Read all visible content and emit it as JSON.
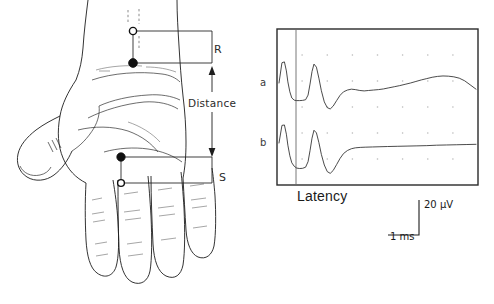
{
  "figure": {
    "background_color": "#ffffff",
    "ink_color": "#1d1d1d",
    "width": 494,
    "height": 304
  },
  "hand_panel": {
    "name": "hand-diagram",
    "description": "Line drawing of a palmar view of a left hand with forearm, showing surface electrode placement",
    "labels": {
      "recording_electrode": "R",
      "stimulating_electrode": "S",
      "distance_label": "Distance"
    },
    "electrodes": [
      {
        "id": "R-reference",
        "label": "R",
        "type": "open-circle",
        "role": "reference"
      },
      {
        "id": "R-active",
        "label": "R",
        "type": "filled-circle",
        "role": "active"
      },
      {
        "id": "S-cathode",
        "label": "S",
        "type": "filled-circle",
        "role": "cathode"
      },
      {
        "id": "S-anode",
        "label": "S",
        "type": "open-circle",
        "role": "anode"
      }
    ]
  },
  "plot_panel": {
    "name": "emg-oscilloscope-trace",
    "x_axis_label": "Latency",
    "trace_labels": [
      "a",
      "b"
    ],
    "scale_bar": {
      "amplitude": "20 µV",
      "time": "1 ms"
    },
    "grid": {
      "columns": 8,
      "rows": 6,
      "style": "dots"
    },
    "cursor": {
      "present": true,
      "orientation": "vertical",
      "meaning": "latency marker"
    }
  },
  "chart_data": {
    "type": "line",
    "title": "",
    "xlabel": "Latency",
    "ylabel": "",
    "grid": true,
    "legend": "none",
    "axis_units": {
      "x": "ms",
      "y": "µV"
    },
    "scale_bar": {
      "x_per_division": "1 ms",
      "y_per_division": "20 µV"
    },
    "xlim": [
      0,
      8
    ],
    "series": [
      {
        "name": "a",
        "label": "a",
        "note": "Upper trace: stimulus artifact, large sensory nerve action potential, then slow broad late wave",
        "x": [
          0.0,
          0.12,
          0.22,
          0.3,
          0.36,
          0.44,
          0.52,
          0.62,
          0.72,
          0.84,
          0.96,
          1.08,
          1.18,
          1.26,
          1.34,
          1.42,
          1.52,
          1.62,
          1.72,
          1.84,
          1.96,
          2.08,
          2.2,
          2.34,
          2.48,
          2.62,
          2.78,
          2.94,
          3.1,
          3.28,
          3.46,
          3.64,
          3.84,
          4.04,
          4.24,
          4.46,
          4.68,
          4.9,
          5.12,
          5.34,
          5.56,
          5.78,
          6.0,
          6.22,
          6.44,
          6.66,
          6.88,
          7.1,
          7.32,
          7.54,
          7.76,
          8.0
        ],
        "y": [
          0.0,
          0.92,
          0.96,
          0.55,
          0.05,
          -0.4,
          -0.68,
          -0.78,
          -0.8,
          -0.8,
          -0.79,
          -0.76,
          -0.55,
          -0.05,
          0.52,
          0.86,
          0.72,
          0.22,
          -0.35,
          -0.86,
          -1.12,
          -1.18,
          -1.05,
          -0.8,
          -0.56,
          -0.4,
          -0.32,
          -0.28,
          -0.3,
          -0.34,
          -0.36,
          -0.34,
          -0.32,
          -0.3,
          -0.27,
          -0.22,
          -0.17,
          -0.12,
          -0.06,
          0.0,
          0.07,
          0.14,
          0.2,
          0.26,
          0.3,
          0.32,
          0.31,
          0.28,
          0.22,
          0.1,
          -0.08,
          -0.28
        ]
      },
      {
        "name": "b",
        "label": "b",
        "note": "Lower trace: stimulus artifact, sensory potential, then flat slowly rising baseline",
        "x": [
          0.0,
          0.12,
          0.22,
          0.3,
          0.36,
          0.44,
          0.52,
          0.62,
          0.72,
          0.84,
          0.96,
          1.08,
          1.18,
          1.26,
          1.34,
          1.42,
          1.52,
          1.62,
          1.72,
          1.84,
          1.96,
          2.08,
          2.2,
          2.34,
          2.48,
          2.62,
          2.78,
          2.94,
          3.1,
          3.3,
          3.5,
          3.8,
          4.1,
          4.4,
          4.8,
          5.2,
          5.6,
          6.0,
          6.4,
          6.8,
          7.2,
          7.6,
          8.0
        ],
        "y": [
          0.0,
          0.8,
          0.82,
          0.4,
          -0.1,
          -0.58,
          -0.9,
          -1.06,
          -1.14,
          -1.16,
          -1.15,
          -1.1,
          -0.85,
          -0.35,
          0.22,
          0.58,
          0.46,
          0.02,
          -0.52,
          -1.0,
          -1.3,
          -1.38,
          -1.25,
          -0.98,
          -0.7,
          -0.48,
          -0.34,
          -0.26,
          -0.22,
          -0.2,
          -0.19,
          -0.18,
          -0.17,
          -0.16,
          -0.15,
          -0.14,
          -0.13,
          -0.12,
          -0.1,
          -0.09,
          -0.08,
          -0.07,
          -0.06
        ]
      }
    ],
    "annotations": [
      {
        "text": "a",
        "position": "left of upper trace"
      },
      {
        "text": "b",
        "position": "left of lower trace"
      },
      {
        "text": "Latency",
        "position": "below plot frame, left-of-center"
      },
      {
        "text": "20 µV",
        "position": "right of vertical scale bar"
      },
      {
        "text": "1 ms",
        "position": "below horizontal scale bar"
      }
    ]
  }
}
